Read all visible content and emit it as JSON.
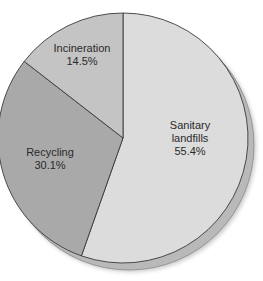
{
  "chart_data": {
    "type": "pie",
    "title": "",
    "start_angle_deg": 0,
    "direction": "clockwise",
    "slices": [
      {
        "label": "Sanitary landfills",
        "label_lines": [
          "Sanitary",
          "landfills"
        ],
        "value": 55.4,
        "value_label": "55.4%",
        "color": "#dcdcdc"
      },
      {
        "label": "Recycling",
        "label_lines": [
          "Recycling"
        ],
        "value": 30.1,
        "value_label": "30.1%",
        "color": "#a9a9a9"
      },
      {
        "label": "Incineration",
        "label_lines": [
          "Incineration"
        ],
        "value": 14.5,
        "value_label": "14.5%",
        "color": "#c4c4c4"
      }
    ],
    "categories": [
      "Sanitary landfills",
      "Recycling",
      "Incineration"
    ],
    "values": [
      55.4,
      30.1,
      14.5
    ],
    "legend": "none",
    "units": "%"
  },
  "style": {
    "rim_color": "#b9b9b9",
    "edge_color": "#3a3a3a",
    "shadow_color": "#9a9a9a"
  }
}
